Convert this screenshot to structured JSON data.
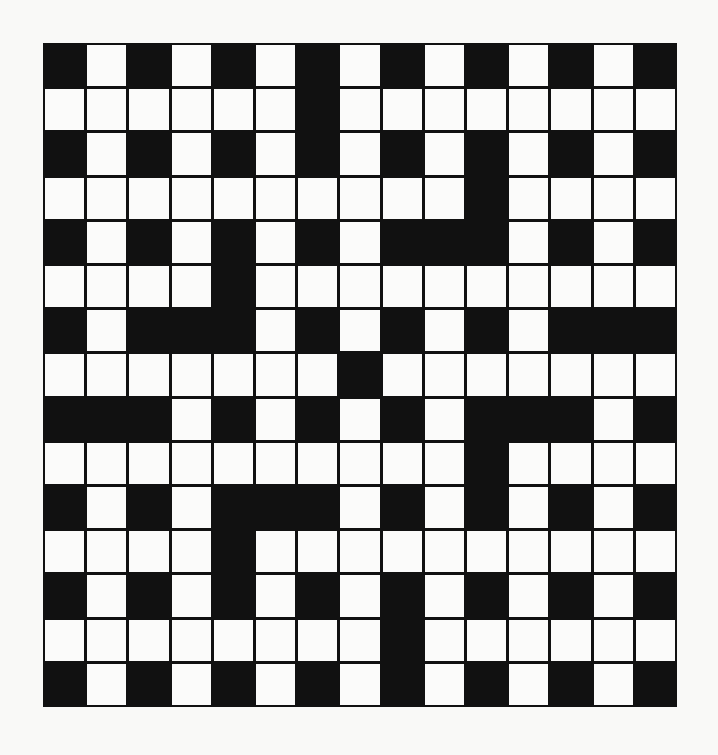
{
  "puzzle": {
    "rows": 15,
    "cols": 15,
    "colors": {
      "block": "#111111",
      "square": "#fbfbfa",
      "background": "#f9f9f7"
    },
    "grid": [
      [
        1,
        0,
        1,
        0,
        1,
        0,
        1,
        0,
        1,
        0,
        1,
        0,
        1,
        0,
        1
      ],
      [
        0,
        0,
        0,
        0,
        0,
        0,
        1,
        0,
        0,
        0,
        0,
        0,
        0,
        0,
        0
      ],
      [
        1,
        0,
        1,
        0,
        1,
        0,
        1,
        0,
        1,
        0,
        1,
        0,
        1,
        0,
        1
      ],
      [
        0,
        0,
        0,
        0,
        0,
        0,
        0,
        0,
        0,
        0,
        1,
        0,
        0,
        0,
        0
      ],
      [
        1,
        0,
        1,
        0,
        1,
        0,
        1,
        0,
        1,
        1,
        1,
        0,
        1,
        0,
        1
      ],
      [
        0,
        0,
        0,
        0,
        1,
        0,
        0,
        0,
        0,
        0,
        0,
        0,
        0,
        0,
        0
      ],
      [
        1,
        0,
        1,
        1,
        1,
        0,
        1,
        0,
        1,
        0,
        1,
        0,
        1,
        1,
        1
      ],
      [
        0,
        0,
        0,
        0,
        0,
        0,
        0,
        1,
        0,
        0,
        0,
        0,
        0,
        0,
        0
      ],
      [
        1,
        1,
        1,
        0,
        1,
        0,
        1,
        0,
        1,
        0,
        1,
        1,
        1,
        0,
        1
      ],
      [
        0,
        0,
        0,
        0,
        0,
        0,
        0,
        0,
        0,
        0,
        1,
        0,
        0,
        0,
        0
      ],
      [
        1,
        0,
        1,
        0,
        1,
        1,
        1,
        0,
        1,
        0,
        1,
        0,
        1,
        0,
        1
      ],
      [
        0,
        0,
        0,
        0,
        1,
        0,
        0,
        0,
        0,
        0,
        0,
        0,
        0,
        0,
        0
      ],
      [
        1,
        0,
        1,
        0,
        1,
        0,
        1,
        0,
        1,
        0,
        1,
        0,
        1,
        0,
        1
      ],
      [
        0,
        0,
        0,
        0,
        0,
        0,
        0,
        0,
        1,
        0,
        0,
        0,
        0,
        0,
        0
      ],
      [
        1,
        0,
        1,
        0,
        1,
        0,
        1,
        0,
        1,
        0,
        1,
        0,
        1,
        0,
        1
      ]
    ]
  }
}
